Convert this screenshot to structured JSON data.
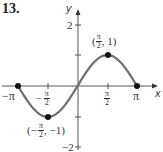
{
  "problem_number": "13.",
  "chart_data": {
    "type": "line",
    "title": "",
    "function": "y = sin(x)",
    "xlabel": "x",
    "ylabel": "y",
    "xlim": [
      -3.14159,
      3.14159
    ],
    "ylim": [
      -2,
      2
    ],
    "x_ticks": [
      "-π",
      "-π/2",
      "π/2",
      "π"
    ],
    "y_ticks": [
      "2",
      "-2"
    ],
    "grid": false,
    "series": [
      {
        "name": "sin(x)",
        "color": "#6e6e6e",
        "x": [
          -3.14159,
          -2.356,
          -1.5708,
          -0.785,
          0,
          0.785,
          1.5708,
          2.356,
          3.14159
        ],
        "y": [
          0,
          -0.707,
          -1,
          -0.707,
          0,
          0.707,
          1,
          0.707,
          0
        ]
      }
    ],
    "marked_points": [
      {
        "x": -3.14159,
        "y": 0,
        "label": ""
      },
      {
        "x": -1.5708,
        "y": -1,
        "label": "(-π/2, -1)"
      },
      {
        "x": 1.5708,
        "y": 1,
        "label": "(π/2, 1)"
      },
      {
        "x": 3.14159,
        "y": 0,
        "label": ""
      }
    ]
  },
  "labels": {
    "x_axis": "x",
    "y_axis": "y",
    "y_tick_2": "2",
    "y_tick_neg2": "−2",
    "x_tick_neg_pi": "−π",
    "x_tick_pi": "π",
    "neg_sign": "−",
    "pi": "π",
    "two": "2",
    "point_max_y": "1",
    "point_min_y": "−1"
  }
}
